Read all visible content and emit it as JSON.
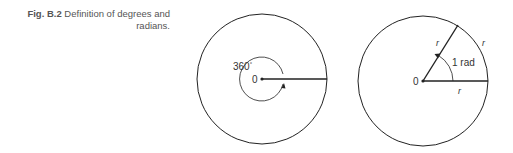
{
  "caption": {
    "label": "Fig. B.2",
    "text": "Definition of degrees and radians."
  },
  "left_diagram": {
    "title": "degrees",
    "angle_label": "360",
    "degree_symbol": "°",
    "center_label": "0"
  },
  "right_diagram": {
    "title": "radians",
    "angle_label": "1 rad",
    "center_label": "0",
    "radius_label_upper": "r",
    "arc_label": "r",
    "radius_label_lower": "r"
  },
  "colors": {
    "line": "#222222",
    "text": "#555555"
  }
}
